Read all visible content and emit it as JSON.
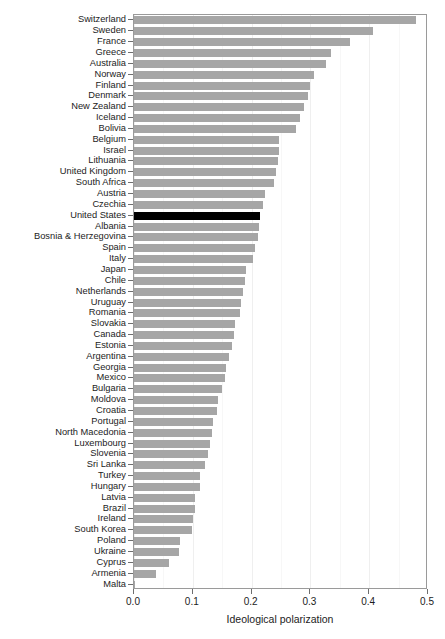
{
  "chart_data": {
    "type": "bar",
    "orientation": "horizontal",
    "title": "",
    "subtitle": "",
    "xlabel": "Ideological polarization",
    "ylabel": "",
    "xlim": [
      0.0,
      0.5
    ],
    "xticks": [
      0.0,
      0.1,
      0.2,
      0.3,
      0.4,
      0.5
    ],
    "xtick_labels": [
      "0.0",
      "0.1",
      "0.2",
      "0.3",
      "0.4",
      "0.5"
    ],
    "grid": true,
    "legend": "none",
    "highlight_category": "United States",
    "colors": {
      "bar": "#a6a6a6",
      "highlight_bar": "#000000",
      "panel_border": "#9a9a9a",
      "gridline": "#efefef",
      "background": "#ffffff",
      "text": "#1c1c1c"
    },
    "categories": [
      "Switzerland",
      "Sweden",
      "France",
      "Greece",
      "Australia",
      "Norway",
      "Finland",
      "Denmark",
      "New Zealand",
      "Iceland",
      "Bolivia",
      "Belgium",
      "Israel",
      "Lithuania",
      "United Kingdom",
      "South Africa",
      "Austria",
      "Czechia",
      "United States",
      "Albania",
      "Bosnia & Herzegovina",
      "Spain",
      "Italy",
      "Japan",
      "Chile",
      "Netherlands",
      "Uruguay",
      "Romania",
      "Slovakia",
      "Canada",
      "Estonia",
      "Argentina",
      "Georgia",
      "Mexico",
      "Bulgaria",
      "Moldova",
      "Croatia",
      "Portugal",
      "North Macedonia",
      "Luxembourg",
      "Slovenia",
      "Sri Lanka",
      "Turkey",
      "Hungary",
      "Latvia",
      "Brazil",
      "Ireland",
      "South Korea",
      "Poland",
      "Ukraine",
      "Cyprus",
      "Armenia",
      "Malta"
    ],
    "values": [
      0.48,
      0.406,
      0.368,
      0.335,
      0.327,
      0.306,
      0.299,
      0.296,
      0.289,
      0.282,
      0.276,
      0.247,
      0.246,
      0.245,
      0.241,
      0.238,
      0.222,
      0.22,
      0.215,
      0.213,
      0.211,
      0.206,
      0.202,
      0.19,
      0.188,
      0.186,
      0.182,
      0.181,
      0.172,
      0.17,
      0.167,
      0.161,
      0.157,
      0.155,
      0.149,
      0.143,
      0.142,
      0.134,
      0.132,
      0.129,
      0.126,
      0.12,
      0.113,
      0.112,
      0.104,
      0.103,
      0.101,
      0.099,
      0.078,
      0.077,
      0.059,
      0.037,
      0.002
    ]
  }
}
